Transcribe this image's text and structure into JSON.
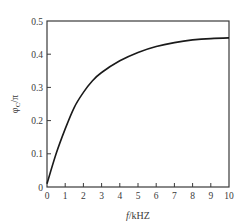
{
  "chart_data": {
    "type": "line",
    "title": "",
    "xlabel": "f/kHZ",
    "xlabel_parts": {
      "italic": "f",
      "rest": "/kHZ"
    },
    "ylabel": "φc/π",
    "ylabel_parts": {
      "main": "φ",
      "sub": "C",
      "rest": "/π"
    },
    "xlim": [
      0,
      10
    ],
    "ylim": [
      0,
      0.5
    ],
    "xticks": [
      "0",
      "1",
      "2",
      "3",
      "4",
      "5",
      "6",
      "7",
      "8",
      "9",
      "10"
    ],
    "yticks": [
      "0",
      "0.1",
      "0.2",
      "0.3",
      "0.4",
      "0.5"
    ],
    "grid": false,
    "legend": null,
    "series": [
      {
        "name": "φc/π",
        "color": "#1a1a1a",
        "x": [
          0,
          0.5,
          1,
          1.5,
          2,
          2.5,
          3,
          4,
          5,
          6,
          7,
          8,
          9,
          10
        ],
        "values": [
          0.01,
          0.1,
          0.175,
          0.24,
          0.285,
          0.32,
          0.345,
          0.38,
          0.405,
          0.423,
          0.435,
          0.443,
          0.447,
          0.449
        ]
      }
    ]
  }
}
